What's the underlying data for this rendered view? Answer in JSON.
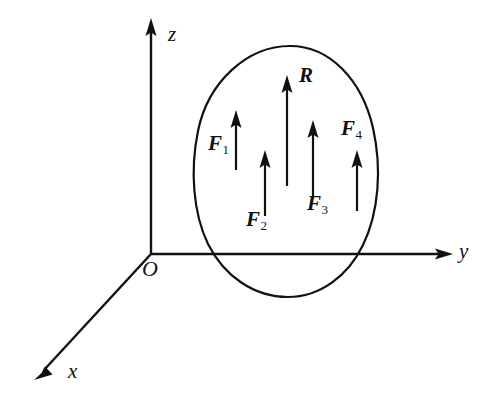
{
  "figure": {
    "type": "3d-axes-force-diagram",
    "background_color": "#ffffff",
    "stroke_color": "#111111",
    "axes": [
      {
        "id": "x",
        "label": "x",
        "direction": "down-left",
        "origin": [
          151,
          254
        ],
        "tip": [
          36,
          378
        ],
        "label_pos": [
          68,
          361
        ]
      },
      {
        "id": "y",
        "label": "y",
        "direction": "right",
        "origin": [
          151,
          254
        ],
        "tip": [
          452,
          254
        ],
        "label_pos": [
          459,
          241
        ]
      },
      {
        "id": "z",
        "label": "z",
        "direction": "up",
        "origin": [
          151,
          254
        ],
        "tip": [
          151,
          20
        ],
        "label_pos": [
          168,
          24
        ]
      }
    ],
    "origin": {
      "label": "O",
      "pos": [
        151,
        254
      ],
      "label_pos": [
        142,
        258
      ]
    },
    "body": {
      "name": "rigid-body-outline",
      "shape": "egg",
      "bounds": {
        "left": 193,
        "right": 376,
        "top": 46,
        "bottom": 297
      }
    },
    "vectors": [
      {
        "id": "F1",
        "label": "F",
        "subscript": "1",
        "x": 236,
        "tail_y": 170,
        "head_y": 111,
        "label_pos": [
          208,
          133
        ]
      },
      {
        "id": "F2",
        "label": "F",
        "subscript": "2",
        "x": 265,
        "tail_y": 216,
        "head_y": 151,
        "label_pos": [
          246,
          209
        ]
      },
      {
        "id": "F3",
        "label": "F",
        "subscript": "3",
        "x": 313,
        "tail_y": 199,
        "head_y": 121,
        "label_pos": [
          307,
          193
        ]
      },
      {
        "id": "F4",
        "label": "F",
        "subscript": "4",
        "x": 357,
        "tail_y": 211,
        "head_y": 151,
        "label_pos": [
          341,
          118
        ]
      },
      {
        "id": "R",
        "label": "R",
        "subscript": "",
        "x": 287,
        "tail_y": 186,
        "head_y": 76,
        "label_pos": [
          299,
          65
        ]
      }
    ]
  }
}
